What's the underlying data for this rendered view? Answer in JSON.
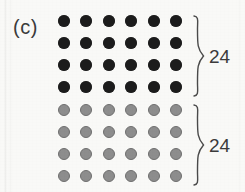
{
  "figure": {
    "panel_label": "(c)",
    "background_color": "#f9f9f7",
    "width": 245,
    "height": 192
  },
  "groups": [
    {
      "id": "dark-group",
      "count_label": "24",
      "dot_color": "#1c1c1c",
      "rows": 4,
      "columns": 6,
      "total_dots": 24
    },
    {
      "id": "gray-group",
      "count_label": "24",
      "dot_color": "#8d8d8d",
      "rows": 4,
      "columns": 6,
      "total_dots": 24
    }
  ],
  "chart_data": {
    "type": "table",
    "title": "(c)",
    "xlabel": "",
    "ylabel": "",
    "categories": [
      "dark dots",
      "gray dots"
    ],
    "values": [
      24,
      24
    ],
    "annotations": [
      "24",
      "24"
    ],
    "layout": {
      "grid": "6 columns x 8 rows",
      "rows_per_group": 4,
      "columns_per_group": 6,
      "legend": "none",
      "braces": "right side, one per group"
    }
  },
  "geometry": {
    "dot_diameter": 12,
    "column_x": [
      64,
      86,
      109,
      131,
      154,
      176
    ],
    "row_y": [
      21,
      43,
      65,
      87,
      110,
      132,
      154,
      176
    ],
    "brace_x": 192,
    "brace_top_group": {
      "top": 15,
      "height": 82
    },
    "brace_bottom_group": {
      "top": 104,
      "height": 82
    },
    "count_x": 209,
    "count_top_y": 56,
    "count_bottom_y": 145
  }
}
